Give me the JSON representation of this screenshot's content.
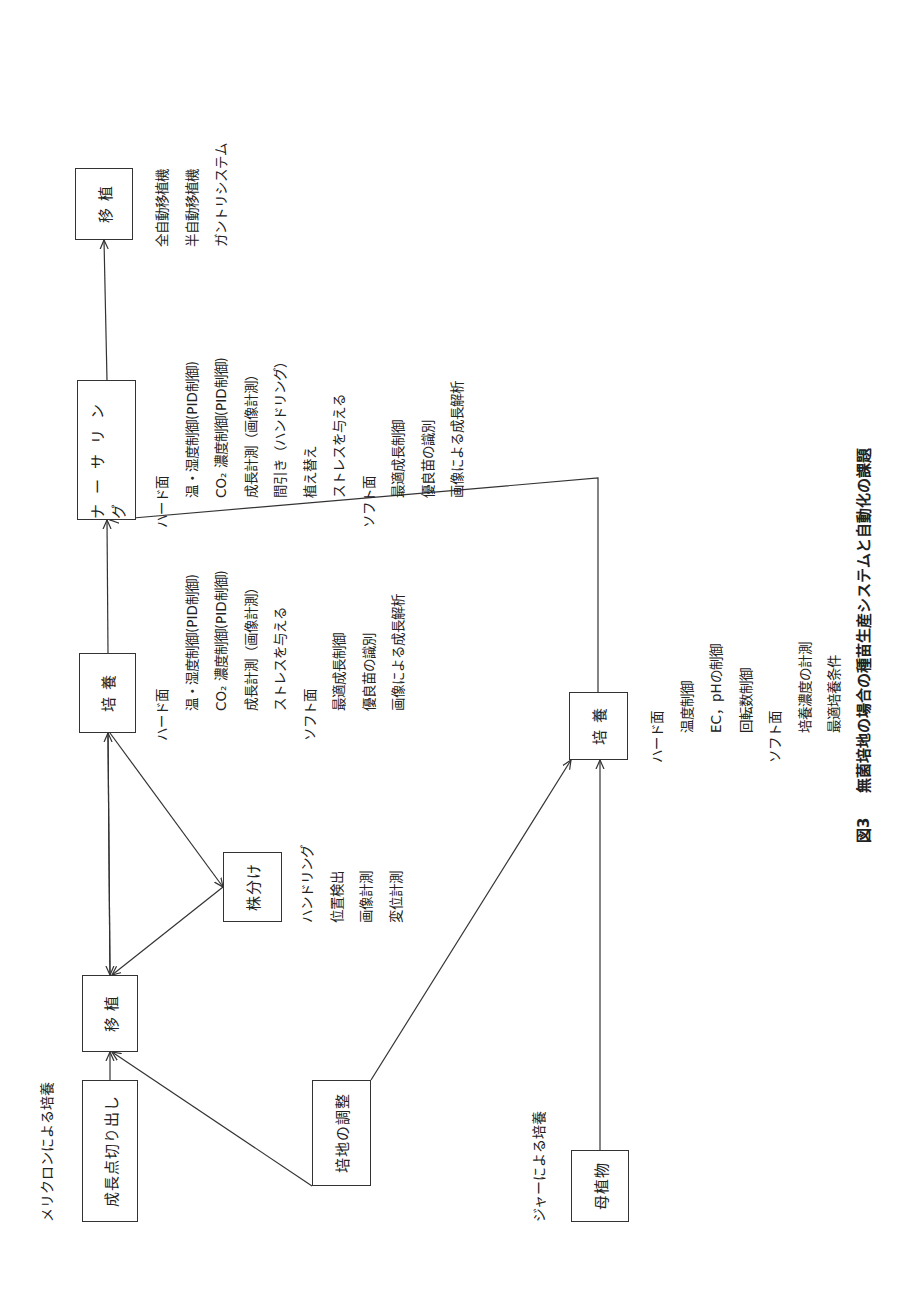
{
  "sections": {
    "meristem_label": "メリクロンによる培養",
    "jar_label": "ジャーによる培養"
  },
  "boxes": {
    "growth_point": "成長点切り出し",
    "transplant_left": "移 植",
    "division": "株分け",
    "medium_prep": "培地の調整",
    "culture_top": "培 養",
    "nursery": "ナーサリング",
    "transplant_right": "移 植",
    "culture_bottom": "培 養",
    "mother_plant": "母植物"
  },
  "division_tasks": [
    "ハンドリング",
    "位置検出",
    "画像計測",
    "変位計測"
  ],
  "culture_top_tasks": {
    "hard_heading": "ハード面",
    "hard": [
      "温・湿度制御(PID制御)",
      "CO₂ 濃度制御(PID制御)",
      "成長計測（画像計測）",
      "ストレスを与える"
    ],
    "soft_heading": "ソフト面",
    "soft": [
      "最適成長制御",
      "優良苗の識別",
      "画像による成長解析"
    ]
  },
  "nursery_tasks": {
    "hard_heading": "ハード面",
    "hard": [
      "温・湿度制御(PID制御)",
      "CO₂ 濃度制御(PID制御)",
      "成長計測（画像計測）",
      "間引き（ハンドリング）",
      "植え替え",
      "ストレスを与える"
    ],
    "soft_heading": "ソフト面",
    "soft": [
      "最適成長制御",
      "優良苗の識別",
      "画像による成長解析"
    ]
  },
  "transplant_tasks": [
    "全自動移植機",
    "半自動移植機",
    "ガントリシステム"
  ],
  "culture_bottom_tasks": {
    "hard_heading": "ハード面",
    "hard": [
      "温度制御",
      "EC，pHの制御",
      "回転数制御"
    ],
    "soft_heading": "ソフト面",
    "soft": [
      "培養濃度の計測",
      "最適培養条件"
    ]
  },
  "caption": {
    "number": "図3",
    "title": "無菌培地の場合の種苗生産システムと自動化の課題"
  }
}
